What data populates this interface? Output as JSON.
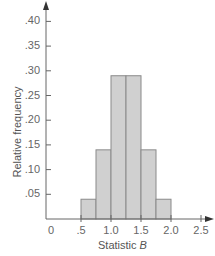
{
  "chart_data": {
    "type": "bar",
    "title": "",
    "xlabel": "Statistic B",
    "xlabel_parts": {
      "text": "Statistic ",
      "italic": "B"
    },
    "ylabel": "Relative frequency",
    "bin_edges": [
      0.5,
      0.75,
      1.0,
      1.25,
      1.5,
      1.75,
      2.0
    ],
    "categories": [
      "0.5-0.75",
      "0.75-1.0",
      "1.0-1.25",
      "1.25-1.5",
      "1.5-1.75",
      "1.75-2.0"
    ],
    "values": [
      0.04,
      0.14,
      0.29,
      0.29,
      0.14,
      0.04
    ],
    "xlim": [
      0,
      2.5
    ],
    "ylim": [
      0,
      0.4
    ],
    "xticks": [
      0,
      0.5,
      1.0,
      1.5,
      2.0,
      2.5
    ],
    "xtick_labels": [
      "0",
      ".5",
      "1.0",
      "1.5",
      "2.0",
      "2.5"
    ],
    "yticks": [
      0.05,
      0.1,
      0.15,
      0.2,
      0.25,
      0.3,
      0.35,
      0.4
    ],
    "ytick_labels": [
      ".05",
      ".10",
      ".15",
      ".20",
      ".25",
      ".30",
      ".35",
      ".40"
    ],
    "grid": false,
    "legend": null,
    "colors": {
      "bar_fill": "#d0d0d0",
      "bar_edge": "#8a8a8a",
      "axis": "#666666"
    }
  }
}
